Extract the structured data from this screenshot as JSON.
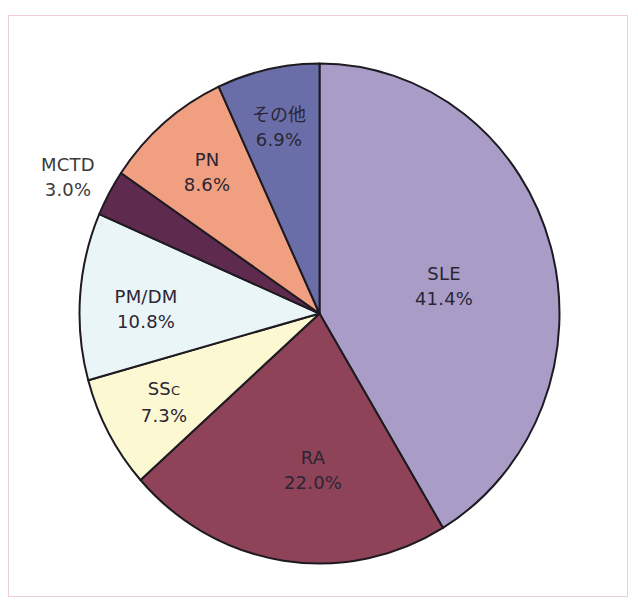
{
  "chart_data": {
    "type": "pie",
    "title": "",
    "start_angle": "12 o'clock",
    "direction": "clockwise",
    "legend": "none (labels on slices)",
    "categories": [
      "SLE",
      "RA",
      "SSc",
      "PM/DM",
      "MCTD",
      "PN",
      "その他"
    ],
    "values": [
      41.4,
      22.0,
      7.3,
      10.8,
      3.0,
      8.6,
      6.9
    ],
    "labels": [
      "41.4%",
      "22.0%",
      "7.3%",
      "10.8%",
      "3.0%",
      "8.6%",
      "6.9%"
    ],
    "colors": [
      "#a99dc8",
      "#8e4358",
      "#fbf8d2",
      "#eaf5f8",
      "#5e2a4e",
      "#f0a080",
      "#6a6ea8"
    ]
  },
  "slices": [
    {
      "name": "SLE",
      "display_name": "SLE",
      "pct_label": "41.4%",
      "value": 41.4,
      "color": "#a99dc8",
      "label_x": 444,
      "label_y": 286,
      "outside": false
    },
    {
      "name": "RA",
      "display_name": "RA",
      "pct_label": "22.0%",
      "value": 22.0,
      "color": "#8e4358",
      "label_x": 313,
      "label_y": 470,
      "outside": false
    },
    {
      "name": "SSc",
      "display_name_main": "SS",
      "display_name_sub": "C",
      "pct_label": "7.3%",
      "value": 7.3,
      "color": "#fbf8d2",
      "label_x": 164,
      "label_y": 402,
      "outside": false
    },
    {
      "name": "PM/DM",
      "display_name": "PM/DM",
      "pct_label": "10.8%",
      "value": 10.8,
      "color": "#eaf5f8",
      "label_x": 146,
      "label_y": 309,
      "outside": false
    },
    {
      "name": "MCTD",
      "display_name": "MCTD",
      "pct_label": "3.0%",
      "value": 3.0,
      "color": "#5e2a4e",
      "label_x": 68,
      "label_y": 177,
      "outside": true
    },
    {
      "name": "PN",
      "display_name": "PN",
      "pct_label": "8.6%",
      "value": 8.6,
      "color": "#f0a080",
      "label_x": 207,
      "label_y": 172,
      "outside": false
    },
    {
      "name": "その他",
      "display_name": "その他",
      "pct_label": "6.9%",
      "value": 6.9,
      "color": "#6a6ea8",
      "label_x": 279,
      "label_y": 127,
      "outside": false
    }
  ],
  "geometry": {
    "cx": 319.5,
    "cy": 313.5,
    "rx": 240,
    "ry": 250,
    "stroke": "#1e1a22"
  },
  "frame": {
    "border_color": "#f1cdd6"
  }
}
